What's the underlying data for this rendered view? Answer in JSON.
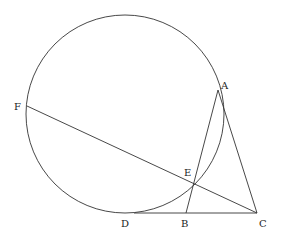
{
  "diagram": {
    "type": "geometry",
    "circle": {
      "cx": 125,
      "cy": 114,
      "r": 99
    },
    "points": {
      "A": {
        "x": 218,
        "y": 90,
        "label": "A",
        "lx": 221,
        "ly": 89
      },
      "B": {
        "x": 186,
        "y": 213,
        "label": "B",
        "lx": 181,
        "ly": 227
      },
      "C": {
        "x": 257,
        "y": 213,
        "label": "C",
        "lx": 259,
        "ly": 227
      },
      "D": {
        "x": 134,
        "y": 213,
        "label": "D",
        "lx": 121,
        "ly": 227
      },
      "E": {
        "x": 193,
        "y": 183,
        "label": "E",
        "lx": 184,
        "ly": 176
      },
      "F": {
        "x": 27,
        "y": 106,
        "label": "F",
        "lx": 14,
        "ly": 110
      }
    },
    "segments": [
      [
        "A",
        "B"
      ],
      [
        "A",
        "C"
      ],
      [
        "D",
        "C"
      ],
      [
        "F",
        "C"
      ]
    ]
  }
}
